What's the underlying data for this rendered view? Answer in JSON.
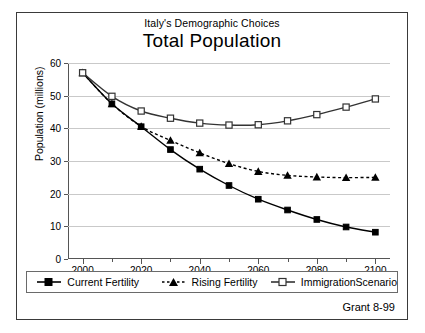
{
  "figure": {
    "subtitle": "Italy's Demographic Choices",
    "title": "Total Population",
    "credit": "Grant 8-99"
  },
  "chart_data": {
    "type": "line",
    "title": "Total Population",
    "subtitle": "Italy's Demographic Choices",
    "xlabel": "",
    "ylabel": "Population (millions)",
    "x": [
      2000,
      2010,
      2020,
      2030,
      2040,
      2050,
      2060,
      2070,
      2080,
      2090,
      2100
    ],
    "xlim": [
      1995,
      2105
    ],
    "ylim": [
      0,
      60
    ],
    "xticks": [
      2000,
      2020,
      2040,
      2060,
      2080,
      2100
    ],
    "xticks_minor": [
      2010,
      2030,
      2050,
      2070,
      2090
    ],
    "yticks": [
      0,
      10,
      20,
      30,
      40,
      50,
      60
    ],
    "grid": "horizontal",
    "legend_position": "below-axes",
    "series": [
      {
        "name": "Current Fertility",
        "marker": "filled-square",
        "line": "solid",
        "color": "#000000",
        "values": [
          57.0,
          47.5,
          40.5,
          33.5,
          27.5,
          22.5,
          18.3,
          15.0,
          12.1,
          9.8,
          8.2
        ]
      },
      {
        "name": "Rising Fertility",
        "marker": "filled-triangle",
        "line": "dotted",
        "color": "#000000",
        "values": [
          57.0,
          47.5,
          40.6,
          36.3,
          32.5,
          29.2,
          26.8,
          25.6,
          25.1,
          24.9,
          25.0
        ]
      },
      {
        "name": "ImmigrationScenario",
        "marker": "open-square",
        "line": "solid",
        "color": "#333333",
        "values": [
          57.0,
          49.8,
          45.3,
          43.1,
          41.6,
          41.0,
          41.1,
          42.3,
          44.2,
          46.5,
          49.0
        ]
      }
    ]
  },
  "legend": [
    {
      "label": "Current Fertility"
    },
    {
      "label": "Rising Fertility"
    },
    {
      "label": "ImmigrationScenario"
    }
  ]
}
